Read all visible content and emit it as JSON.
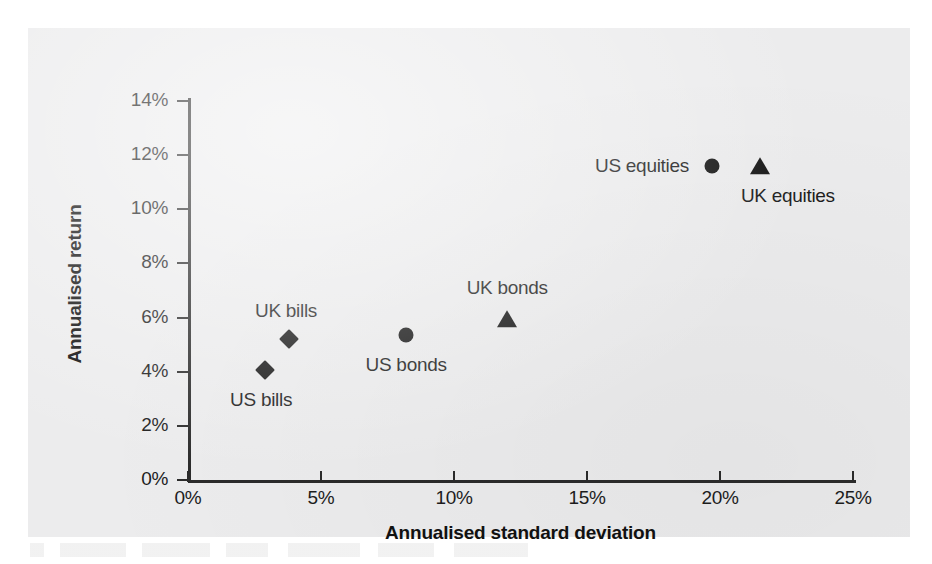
{
  "chart_data": {
    "type": "scatter",
    "title": "",
    "xlabel": "Annualised standard deviation",
    "ylabel": "Annualised return",
    "xlim": [
      0,
      25
    ],
    "ylim": [
      0,
      14
    ],
    "xticks": [
      "0%",
      "5%",
      "10%",
      "15%",
      "20%",
      "25%"
    ],
    "xtick_values": [
      0,
      5,
      10,
      15,
      20,
      25
    ],
    "yticks": [
      "0%",
      "2%",
      "4%",
      "6%",
      "8%",
      "10%",
      "12%",
      "14%"
    ],
    "ytick_values": [
      0,
      2,
      4,
      6,
      8,
      10,
      12,
      14
    ],
    "grid": false,
    "legend": "none",
    "points": [
      {
        "label": "US bills",
        "x": 2.9,
        "y": 4.05,
        "marker": "diamond",
        "label_dx": -4,
        "label_dy": 30
      },
      {
        "label": "UK bills",
        "x": 3.8,
        "y": 5.2,
        "marker": "diamond",
        "label_dx": -3,
        "label_dy": -28
      },
      {
        "label": "US bonds",
        "x": 8.2,
        "y": 5.35,
        "marker": "circle",
        "label_dx": 0,
        "label_dy": 30
      },
      {
        "label": "UK bonds",
        "x": 12.0,
        "y": 5.9,
        "marker": "triangle",
        "label_dx": 0,
        "label_dy": -32
      },
      {
        "label": "US equities",
        "x": 19.7,
        "y": 11.6,
        "marker": "circle",
        "label_dx": -70,
        "label_dy": 0
      },
      {
        "label": "UK equities",
        "x": 21.5,
        "y": 11.55,
        "marker": "triangle",
        "label_dx": 28,
        "label_dy": 29
      }
    ]
  },
  "figure": {
    "background_color": "#ececed",
    "axis_color": "#2b2b2b",
    "marker_color": "#161616",
    "text_color": "#1d1d1d"
  }
}
